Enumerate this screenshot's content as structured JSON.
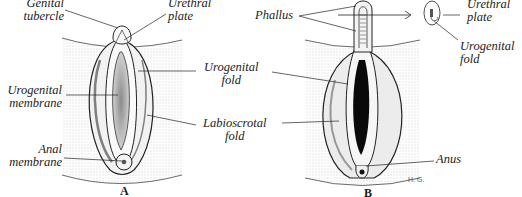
{
  "figure_a": {
    "panel_label": "A",
    "labels": {
      "genital_tubercle": [
        "Genital",
        "tubercle"
      ],
      "urethral_plate": [
        "Urethral",
        "plate"
      ],
      "urogenital_membrane": [
        "Urogenital",
        "membrane"
      ],
      "anal_membrane": [
        "Anal",
        "membrane"
      ]
    }
  },
  "shared_labels": {
    "urogenital_fold": [
      "Urogenital",
      "fold"
    ],
    "labioscrotal_fold": [
      "Labioscrotal",
      "fold"
    ]
  },
  "figure_b": {
    "panel_label": "B",
    "labels": {
      "phallus": "Phallus",
      "urethral_plate": [
        "Urethral",
        "plate"
      ],
      "urogenital_fold": [
        "Urogenital",
        "fold"
      ],
      "anus": "Anus"
    },
    "signature": "H. G."
  },
  "colors": {
    "ink": "#222222",
    "stipple": "#d8d8d8",
    "dark": "#0a0a0a"
  }
}
